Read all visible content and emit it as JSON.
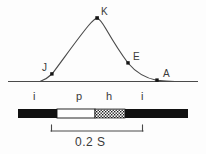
{
  "figure": {
    "background_color": "#fdfdfd",
    "line_color": "#3a3a3a",
    "bar_color": "#111111"
  },
  "curve_points": [
    {
      "id": "J",
      "label": "J",
      "x": 52,
      "y": 74,
      "label_x": 42,
      "label_y": 64
    },
    {
      "id": "K",
      "label": "K",
      "x": 97,
      "y": 18,
      "label_x": 101,
      "label_y": 8
    },
    {
      "id": "E",
      "label": "E",
      "x": 128,
      "y": 63,
      "label_x": 133,
      "label_y": 53
    },
    {
      "id": "A",
      "label": "A",
      "x": 157,
      "y": 80,
      "label_x": 163,
      "label_y": 70
    }
  ],
  "interval_labels": [
    {
      "id": "i-left",
      "label": "i",
      "x": 35
    },
    {
      "id": "p",
      "label": "p",
      "x": 78
    },
    {
      "id": "h",
      "label": "h",
      "x": 108
    },
    {
      "id": "i-right",
      "label": "i",
      "x": 143
    }
  ],
  "bar_segments": [
    {
      "id": "segment-black-left",
      "fill": "black",
      "x": 18,
      "width": 39
    },
    {
      "id": "segment-white",
      "fill": "white",
      "x": 57,
      "width": 38
    },
    {
      "id": "segment-hatched",
      "fill": "hatched",
      "x": 95,
      "width": 30
    },
    {
      "id": "segment-black-right",
      "fill": "black",
      "x": 125,
      "width": 63
    }
  ],
  "scale_bar": {
    "label": "0.2 S",
    "x_start": 51,
    "x_end": 143,
    "y": 131,
    "label_x": 97,
    "label_y": 138
  },
  "baseline": {
    "x_start": 8,
    "x_end": 198,
    "y": 81
  }
}
